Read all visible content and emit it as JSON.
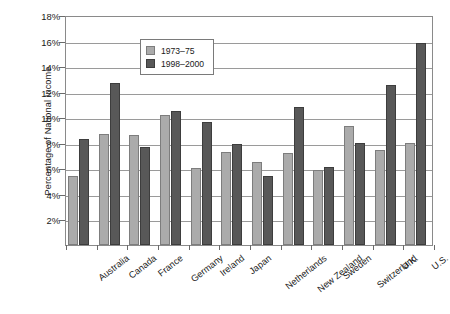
{
  "chart_data": {
    "type": "bar",
    "title": "",
    "xlabel": "",
    "ylabel": "Percentage of National Income",
    "ylim": [
      0,
      18
    ],
    "ytick_values": [
      2,
      4,
      6,
      8,
      10,
      12,
      14,
      16,
      18
    ],
    "ytick_labels": [
      "2%",
      "4%",
      "6%",
      "8%",
      "10%",
      "12%",
      "14%",
      "16%",
      "18%"
    ],
    "grid": true,
    "legend_position": "top-left",
    "categories": [
      "Australia",
      "Canada",
      "France",
      "Germany",
      "Ireland",
      "Japan",
      "Netherlands",
      "New Zealand",
      "Sweden",
      "Switzerland",
      "U.K.",
      "U.S."
    ],
    "series": [
      {
        "name": "1973–75",
        "color": "#ababab",
        "values": [
          5.4,
          8.7,
          8.6,
          10.2,
          6.0,
          7.3,
          6.5,
          7.2,
          5.9,
          9.3,
          7.4,
          8.0
        ]
      },
      {
        "name": "1998–2000",
        "color": "#585858",
        "values": [
          8.3,
          12.7,
          7.7,
          10.5,
          9.6,
          7.9,
          5.4,
          10.8,
          6.1,
          8.0,
          12.5,
          15.8
        ]
      }
    ]
  }
}
